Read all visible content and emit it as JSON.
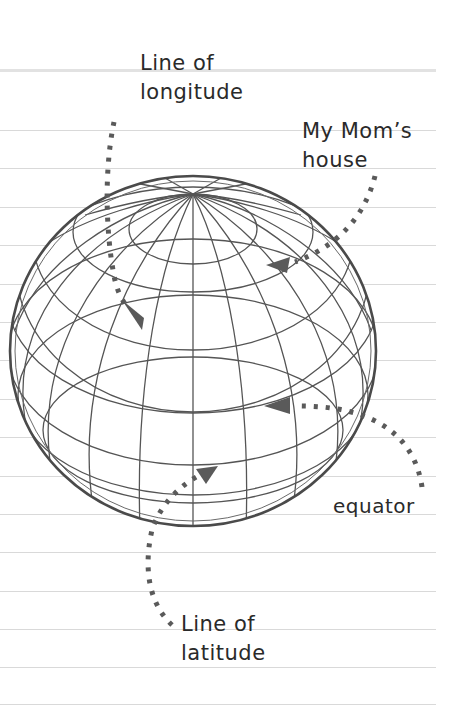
{
  "diagram": {
    "labels": {
      "longitude": {
        "line1": "Line of",
        "line2": "longitude"
      },
      "moms_house": {
        "line1": "My Mom’s",
        "line2": "house"
      },
      "equator": {
        "line1": "equator"
      },
      "latitude": {
        "line1": "Line of",
        "line2": "latitude"
      }
    },
    "colors": {
      "ink": "#2a2a2a",
      "globe_line": "#555555",
      "arrow": "#5a5a5a",
      "ruled_line": "#d9d9d9",
      "paper": "#ffffff"
    }
  }
}
